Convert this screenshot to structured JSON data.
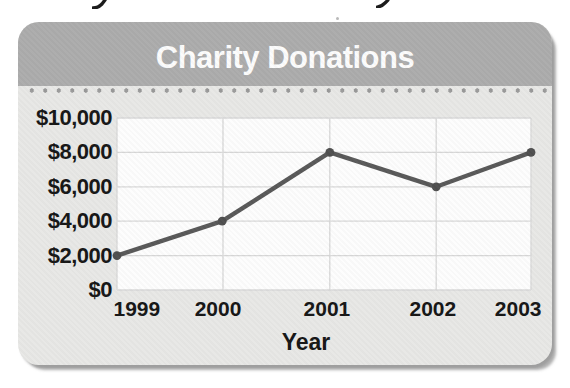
{
  "card": {
    "title": "Charity Donations"
  },
  "chart_data": {
    "type": "line",
    "title": "Charity Donations",
    "categories": [
      "1999",
      "2000",
      "2001",
      "2002",
      "2003"
    ],
    "values": [
      2000,
      4000,
      8000,
      6000,
      8000
    ],
    "series": [
      {
        "name": "Charity Donations",
        "values": [
          2000,
          4000,
          8000,
          6000,
          8000
        ]
      }
    ],
    "xlabel": "Year",
    "ylabel": "",
    "ylim": [
      0,
      10000
    ],
    "y_ticks": [
      {
        "value": 10000,
        "label": "$10,000"
      },
      {
        "value": 8000,
        "label": "$8,000"
      },
      {
        "value": 6000,
        "label": "$6,000"
      },
      {
        "value": 4000,
        "label": "$4,000"
      },
      {
        "value": 2000,
        "label": "$2,000"
      },
      {
        "value": 0,
        "label": "$0"
      }
    ],
    "grid": true,
    "legend": "none",
    "layout": {
      "v_grid_pct": [
        0,
        25.6,
        51.4,
        77.1,
        100
      ],
      "x_point_pct": [
        0,
        25.4,
        51.4,
        77.1,
        100
      ],
      "x_label_pct": [
        4.8,
        24.4,
        50.7,
        76.3,
        96.9
      ],
      "plot_width": 414,
      "plot_height": 172
    }
  },
  "colors": {
    "page_bg": "#ffffff",
    "card_bg": "#e8e8e6",
    "header_bg": "#acacac",
    "title_color": "#fcfcfc",
    "dot_row_color": "#9a9a9a",
    "plot_bg": "#fdfdfd",
    "gridline_color": "#d8d8d8",
    "line_color": "#595959",
    "point_color": "#4f4f4f",
    "axis_text": "#161616",
    "shadow": "#9e9e9e"
  },
  "icons": {
    "artifact_left": "cropped-descender-mark",
    "artifact_right": "cropped-descender-mark",
    "speck": "paper-speck"
  }
}
